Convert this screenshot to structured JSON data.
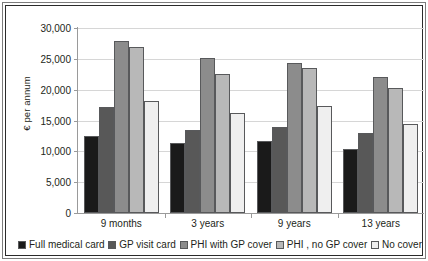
{
  "chart_data": {
    "type": "bar",
    "title": "",
    "subtitle": "",
    "xlabel": "",
    "ylabel": "€ per annum",
    "categories": [
      "9 months",
      "3 years",
      "9 years",
      "13 years"
    ],
    "ylim": [
      0,
      30000
    ],
    "yticks": [
      0,
      5000,
      10000,
      15000,
      20000,
      25000,
      30000
    ],
    "ytick_labels": [
      "0",
      "5,000",
      "10,000",
      "15,000",
      "20,000",
      "25,000",
      "30,000"
    ],
    "grid": true,
    "legend_position": "bottom",
    "series": [
      {
        "name": "Full medical card",
        "color": "#1a1a1a",
        "values": [
          12550,
          11300,
          11600,
          10400
        ]
      },
      {
        "name": "GP visit card",
        "color": "#585858",
        "values": [
          17250,
          13400,
          13900,
          13050
        ]
      },
      {
        "name": "PHI with GP cover",
        "color": "#8c8c8c",
        "values": [
          27900,
          25100,
          24350,
          22050
        ]
      },
      {
        "name": "PHI , no GP cover",
        "color": "#b8b8b8",
        "values": [
          27000,
          22550,
          23450,
          20200
        ]
      },
      {
        "name": "No cover",
        "color": "#efefef",
        "values": [
          18100,
          16200,
          17400,
          14450
        ]
      }
    ]
  }
}
